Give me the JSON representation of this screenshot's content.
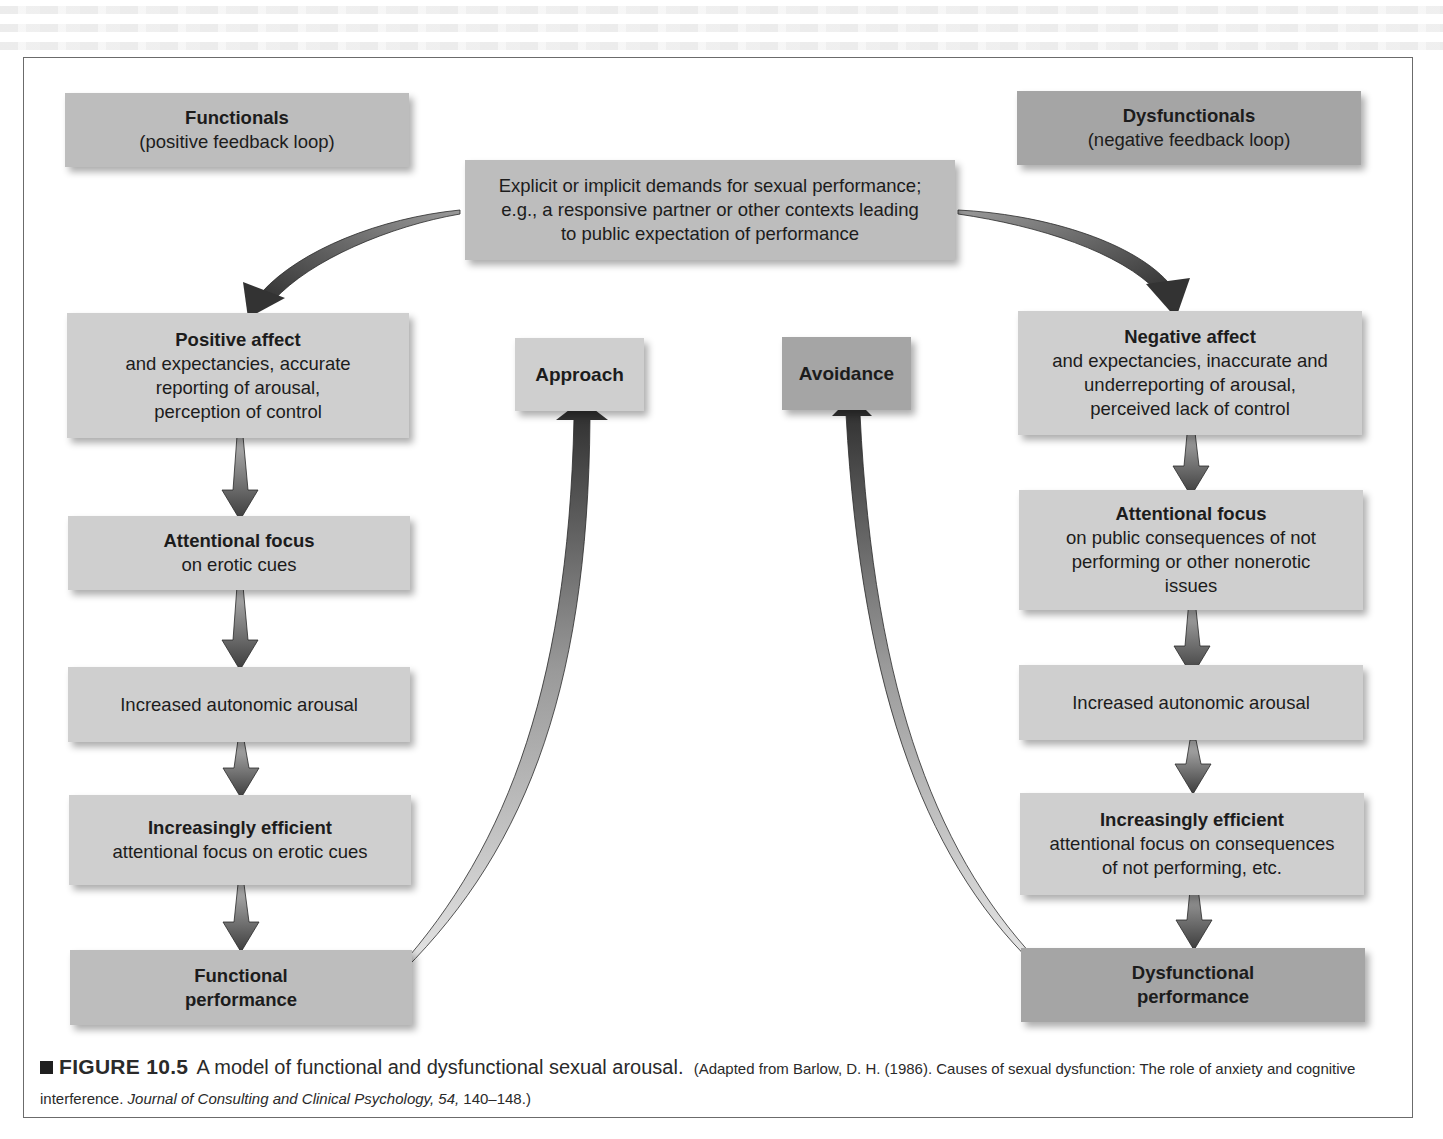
{
  "diagram": {
    "headers": {
      "left": {
        "title": "Functionals",
        "subtitle": "(positive feedback loop)"
      },
      "right": {
        "title": "Dysfunctionals",
        "subtitle": "(negative feedback loop)"
      }
    },
    "trigger": {
      "lines": [
        "Explicit or implicit demands for sexual performance;",
        "e.g., a responsive partner or other contexts leading",
        "to public expectation of performance"
      ]
    },
    "outcomes": {
      "approach": "Approach",
      "avoidance": "Avoidance"
    },
    "functional_chain": [
      {
        "title": "Positive affect",
        "body": [
          "and expectancies, accurate",
          "reporting of arousal,",
          "perception of control"
        ]
      },
      {
        "title": "Attentional focus",
        "body": [
          "on erotic cues"
        ]
      },
      {
        "title": "",
        "body": [
          "Increased autonomic arousal"
        ]
      },
      {
        "title": "Increasingly efficient",
        "body": [
          "attentional focus on erotic cues"
        ]
      },
      {
        "title": "Functional",
        "body": [
          "performance"
        ]
      }
    ],
    "dysfunctional_chain": [
      {
        "title": "Negative affect",
        "body": [
          "and expectancies, inaccurate and",
          "underreporting of arousal,",
          "perceived lack of control"
        ]
      },
      {
        "title": "Attentional focus",
        "body": [
          "on public consequences of not",
          "performing or other nonerotic",
          "issues"
        ]
      },
      {
        "title": "",
        "body": [
          "Increased autonomic arousal"
        ]
      },
      {
        "title": "Increasingly efficient",
        "body": [
          "attentional focus on consequences",
          "of not performing, etc."
        ]
      },
      {
        "title": "Dysfunctional",
        "body": [
          "performance"
        ]
      }
    ],
    "edges": [
      {
        "from": "trigger",
        "to": "Positive affect"
      },
      {
        "from": "trigger",
        "to": "Negative affect"
      },
      {
        "from": "Positive affect",
        "to": "Attentional focus (erotic cues)"
      },
      {
        "from": "Attentional focus (erotic cues)",
        "to": "Increased autonomic arousal"
      },
      {
        "from": "Increased autonomic arousal",
        "to": "Increasingly efficient (erotic cues)"
      },
      {
        "from": "Increasingly efficient (erotic cues)",
        "to": "Functional performance"
      },
      {
        "from": "Functional performance",
        "to": "Approach"
      },
      {
        "from": "Negative affect",
        "to": "Attentional focus (public consequences)"
      },
      {
        "from": "Attentional focus (public consequences)",
        "to": "Increased autonomic arousal"
      },
      {
        "from": "Increased autonomic arousal",
        "to": "Increasingly efficient (consequences)"
      },
      {
        "from": "Increasingly efficient (consequences)",
        "to": "Dysfunctional performance"
      },
      {
        "from": "Dysfunctional performance",
        "to": "Avoidance"
      }
    ],
    "colors": {
      "light_box": "#cfcfcf",
      "mid_box": "#bdbdbd",
      "dark_box": "#a5a5a5",
      "arrow_dark": "#3a3a3a",
      "frame": "#6b6b6b"
    }
  },
  "caption": {
    "label": "FIGURE 10.5",
    "description": "A model of functional and dysfunctional sexual arousal.",
    "citation_pre": "(Adapted from Barlow, D. H. (1986). Causes of sexual dysfunction: The role of anxiety and cognitive interference.",
    "journal": "Journal of Consulting and Clinical Psychology, 54,",
    "pages": "140–148.)"
  }
}
